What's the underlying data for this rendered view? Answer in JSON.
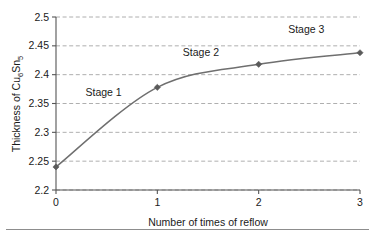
{
  "chart_data": {
    "type": "line",
    "title": "",
    "xlabel": "Number of times of reflow",
    "ylabel": "Thickness of Cu6Sn5",
    "ylabel_parts": {
      "prefix": "Thickness of Cu",
      "sub1": "6",
      "mid": "Sn",
      "sub2": "5"
    },
    "x": [
      0,
      1,
      2,
      3
    ],
    "values": [
      2.24,
      2.378,
      2.418,
      2.438
    ],
    "series": [
      {
        "name": "Thickness of Cu6Sn5",
        "values": [
          2.24,
          2.378,
          2.418,
          2.438
        ]
      }
    ],
    "xlim": [
      0,
      3
    ],
    "ylim": [
      2.2,
      2.5
    ],
    "xticks": [
      "0",
      "1",
      "2",
      "3"
    ],
    "yticks": [
      "2.2",
      "2.25",
      "2.3",
      "2.35",
      "2.4",
      "2.45",
      "2.5"
    ],
    "xtick_values": [
      0,
      1,
      2,
      3
    ],
    "ytick_values": [
      2.2,
      2.25,
      2.3,
      2.35,
      2.4,
      2.45,
      2.5
    ],
    "grid": "horizontal-dashed",
    "legend": "none",
    "marker": "diamond",
    "annotations": [
      {
        "text": "Stage 1",
        "x": 0.47,
        "y": 2.363
      },
      {
        "text": "Stage 2",
        "x": 1.43,
        "y": 2.432
      },
      {
        "text": "Stage 3",
        "x": 2.47,
        "y": 2.472
      }
    ],
    "colors": {
      "line": "#6f6f6f",
      "marker": "#5a5a5a",
      "grid": "#9a9a9a",
      "axis": "#555555",
      "text": "#1a1a1a",
      "background": "#ffffff"
    }
  }
}
